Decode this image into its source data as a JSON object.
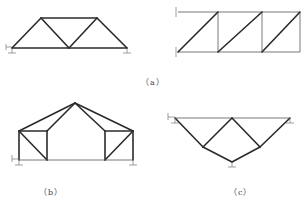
{
  "figure": {
    "panels": [
      {
        "id": "a",
        "label": "（a）",
        "description": "Two trusses: simply supported triangular-panel truss (left) and cantilever truss with Z-diagonals fixed to wall (right)"
      },
      {
        "id": "b",
        "label": "（b）",
        "description": "Roof truss with apex and two end boxes, pin supports at both ends"
      },
      {
        "id": "c",
        "label": "（c）",
        "description": "Inverted triangular truss with supports at two top ends and bottom center"
      }
    ],
    "colors": {
      "member": "#2b2b2b",
      "support": "#777777",
      "background": "#ffffff"
    }
  },
  "labels": {
    "a": "（a）",
    "b": "（b）",
    "c": "（c）"
  }
}
